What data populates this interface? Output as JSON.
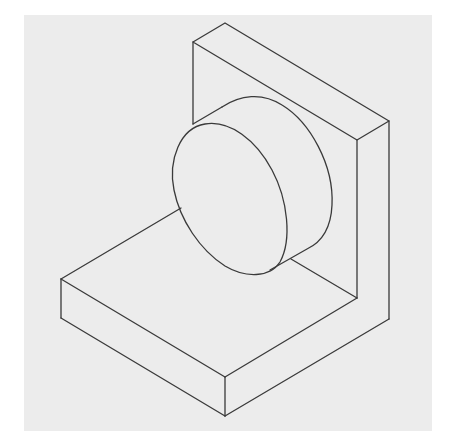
{
  "figure": {
    "background_color": "#ececec",
    "line_color": "#3a3a3a",
    "parts": [
      {
        "name": "base-plate",
        "label": "Base plate"
      },
      {
        "name": "back-plate",
        "label": "Upright back plate"
      },
      {
        "name": "cylinder",
        "label": "Cylindrical boss"
      }
    ]
  }
}
